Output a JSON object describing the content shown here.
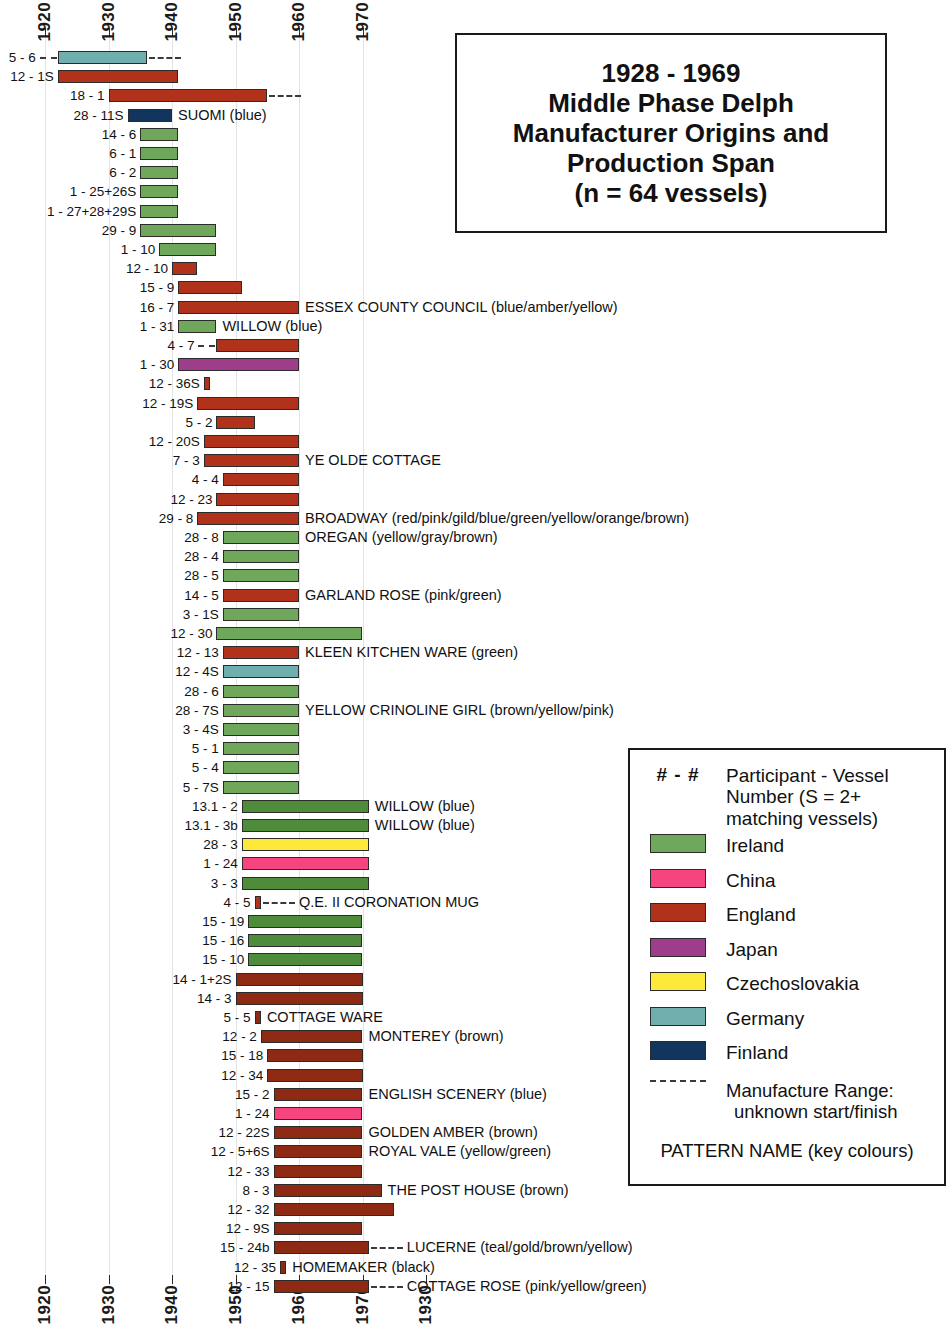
{
  "title": {
    "line1": "1928 - 1969",
    "line2": "Middle Phase Delph",
    "line3": "Manufacturer Origins and",
    "line4": "Production Span",
    "line5": "(n = 64 vessels)"
  },
  "axis": {
    "top_ticks": [
      "1920",
      "1930",
      "1940",
      "1950",
      "1960",
      "1970"
    ],
    "bottom_ticks": [
      "1920",
      "1930",
      "1940",
      "1950",
      "1960",
      "1970",
      "1930"
    ]
  },
  "legend": {
    "key_symbol": "# - #",
    "key_description_l1": "Participant - Vessel",
    "key_description_l2": "Number (S = 2+",
    "key_description_l3": "matching vessels)",
    "countries": [
      {
        "label": "Ireland",
        "color": "#6fa85a"
      },
      {
        "label": "China",
        "color": "#f5447e"
      },
      {
        "label": "England",
        "color": "#b0321a"
      },
      {
        "label": "Japan",
        "color": "#9e3d8c"
      },
      {
        "label": "Czechoslovakia",
        "color": "#fce93a"
      },
      {
        "label": "Germany",
        "color": "#6fb0ae"
      },
      {
        "label": "Finland",
        "color": "#12355e"
      }
    ],
    "range_note_l1": "Manufacture Range:",
    "range_note_l2": "unknown start/finish",
    "footer": "PATTERN NAME (key colours)"
  },
  "chart_data": {
    "type": "bar",
    "title": "1928 - 1969 Middle Phase Delph Manufacturer Origins and Production Span (n = 64 vessels)",
    "xlabel": "",
    "ylabel": "",
    "xlim": [
      1917,
      1978
    ],
    "grid": true,
    "legend_position": "bottom-right",
    "orientation": "horizontal",
    "note": "Each row is one participant-vessel: a coloured span bar for known manufacture range, dashed line for unknown start/finish.",
    "rows": [
      {
        "id": "5 - 6",
        "country": "Germany",
        "color": "#6fb0ae",
        "start": 1922,
        "end": 1936,
        "dash_left": true,
        "dash_right": true,
        "pattern": ""
      },
      {
        "id": "12 - 1S",
        "country": "England",
        "color": "#b0321a",
        "start": 1922,
        "end": 1941,
        "dash_left": false,
        "dash_right": false,
        "pattern": ""
      },
      {
        "id": "18 - 1",
        "country": "England",
        "color": "#b0321a",
        "start": 1930,
        "end": 1955,
        "dash_left": false,
        "dash_right": true,
        "pattern": ""
      },
      {
        "id": "28 - 11S",
        "country": "Finland",
        "color": "#12355e",
        "start": 1933,
        "end": 1940,
        "dash_left": false,
        "dash_right": false,
        "pattern": "SUOMI (blue)"
      },
      {
        "id": "14 - 6",
        "country": "Ireland",
        "color": "#6fa85a",
        "start": 1935,
        "end": 1941,
        "dash_left": false,
        "dash_right": false,
        "pattern": ""
      },
      {
        "id": "6 - 1",
        "country": "Ireland",
        "color": "#6fa85a",
        "start": 1935,
        "end": 1941,
        "dash_left": false,
        "dash_right": false,
        "pattern": ""
      },
      {
        "id": "6 - 2",
        "country": "Ireland",
        "color": "#6fa85a",
        "start": 1935,
        "end": 1941,
        "dash_left": false,
        "dash_right": false,
        "pattern": ""
      },
      {
        "id": "1 - 25+26S",
        "country": "Ireland",
        "color": "#6fa85a",
        "start": 1935,
        "end": 1941,
        "dash_left": false,
        "dash_right": false,
        "pattern": ""
      },
      {
        "id": "1 - 27+28+29S",
        "country": "Ireland",
        "color": "#6fa85a",
        "start": 1935,
        "end": 1941,
        "dash_left": false,
        "dash_right": false,
        "pattern": ""
      },
      {
        "id": "29 - 9",
        "country": "Ireland",
        "color": "#6fa85a",
        "start": 1935,
        "end": 1947,
        "dash_left": false,
        "dash_right": false,
        "pattern": ""
      },
      {
        "id": "1 - 10",
        "country": "Ireland",
        "color": "#6fa85a",
        "start": 1938,
        "end": 1947,
        "dash_left": false,
        "dash_right": false,
        "pattern": ""
      },
      {
        "id": "12 - 10",
        "country": "England",
        "color": "#b0321a",
        "start": 1940,
        "end": 1944,
        "dash_left": false,
        "dash_right": false,
        "pattern": ""
      },
      {
        "id": "15 - 9",
        "country": "England",
        "color": "#b0321a",
        "start": 1941,
        "end": 1951,
        "dash_left": false,
        "dash_right": false,
        "pattern": ""
      },
      {
        "id": "16 - 7",
        "country": "England",
        "color": "#b0321a",
        "start": 1941,
        "end": 1960,
        "dash_left": false,
        "dash_right": false,
        "pattern": "ESSEX COUNTY COUNCIL (blue/amber/yellow)"
      },
      {
        "id": "1 - 31",
        "country": "Ireland",
        "color": "#6fa85a",
        "start": 1941,
        "end": 1947,
        "dash_left": false,
        "dash_right": false,
        "pattern": "WILLOW (blue)"
      },
      {
        "id": "4 - 7",
        "country": "England",
        "color": "#b0321a",
        "start": 1947,
        "end": 1960,
        "dash_left": true,
        "dash_right": false,
        "pattern": ""
      },
      {
        "id": "1 - 30",
        "country": "Japan",
        "color": "#9e3d8c",
        "start": 1941,
        "end": 1960,
        "dash_left": false,
        "dash_right": false,
        "pattern": ""
      },
      {
        "id": "12 - 36S",
        "country": "England",
        "color": "#b0321a",
        "start": 1945,
        "end": 1946,
        "dash_left": false,
        "dash_right": false,
        "pattern": ""
      },
      {
        "id": "12 - 19S",
        "country": "England",
        "color": "#b0321a",
        "start": 1944,
        "end": 1960,
        "dash_left": false,
        "dash_right": false,
        "pattern": ""
      },
      {
        "id": "5 - 2",
        "country": "England",
        "color": "#b0321a",
        "start": 1947,
        "end": 1953,
        "dash_left": false,
        "dash_right": false,
        "pattern": ""
      },
      {
        "id": "12 - 20S",
        "country": "England",
        "color": "#b0321a",
        "start": 1945,
        "end": 1960,
        "dash_left": false,
        "dash_right": false,
        "pattern": ""
      },
      {
        "id": "7 - 3",
        "country": "England",
        "color": "#b0321a",
        "start": 1945,
        "end": 1960,
        "dash_left": false,
        "dash_right": false,
        "pattern": "YE OLDE COTTAGE"
      },
      {
        "id": "4 - 4",
        "country": "England",
        "color": "#b0321a",
        "start": 1948,
        "end": 1960,
        "dash_left": false,
        "dash_right": false,
        "pattern": ""
      },
      {
        "id": "12 - 23",
        "country": "England",
        "color": "#b0321a",
        "start": 1947,
        "end": 1960,
        "dash_left": false,
        "dash_right": false,
        "pattern": ""
      },
      {
        "id": "29 - 8",
        "country": "England",
        "color": "#b0321a",
        "start": 1944,
        "end": 1960,
        "dash_left": false,
        "dash_right": false,
        "pattern": "BROADWAY (red/pink/gild/blue/green/yellow/orange/brown)"
      },
      {
        "id": "28 - 8",
        "country": "Ireland",
        "color": "#6fa85a",
        "start": 1948,
        "end": 1960,
        "dash_left": false,
        "dash_right": false,
        "pattern": "OREGAN (yellow/gray/brown)"
      },
      {
        "id": "28 - 4",
        "country": "Ireland",
        "color": "#6fa85a",
        "start": 1948,
        "end": 1960,
        "dash_left": false,
        "dash_right": false,
        "pattern": ""
      },
      {
        "id": "28 - 5",
        "country": "Ireland",
        "color": "#6fa85a",
        "start": 1948,
        "end": 1960,
        "dash_left": false,
        "dash_right": false,
        "pattern": ""
      },
      {
        "id": "14 - 5",
        "country": "England",
        "color": "#b0321a",
        "start": 1948,
        "end": 1960,
        "dash_left": false,
        "dash_right": false,
        "pattern": "GARLAND ROSE (pink/green)"
      },
      {
        "id": "3 - 1S",
        "country": "Ireland",
        "color": "#6fa85a",
        "start": 1948,
        "end": 1960,
        "dash_left": false,
        "dash_right": false,
        "pattern": ""
      },
      {
        "id": "12 - 30",
        "country": "Ireland",
        "color": "#6fa85a",
        "start": 1947,
        "end": 1970,
        "dash_left": false,
        "dash_right": false,
        "pattern": ""
      },
      {
        "id": "12 - 13",
        "country": "England",
        "color": "#b0321a",
        "start": 1948,
        "end": 1960,
        "dash_left": false,
        "dash_right": false,
        "pattern": "KLEEN KITCHEN WARE (green)"
      },
      {
        "id": "12 - 4S",
        "country": "Germany",
        "color": "#6fb0ae",
        "start": 1948,
        "end": 1960,
        "dash_left": false,
        "dash_right": false,
        "pattern": ""
      },
      {
        "id": "28 - 6",
        "country": "Ireland",
        "color": "#6fa85a",
        "start": 1948,
        "end": 1960,
        "dash_left": false,
        "dash_right": false,
        "pattern": ""
      },
      {
        "id": "28 - 7S",
        "country": "Ireland",
        "color": "#6fa85a",
        "start": 1948,
        "end": 1960,
        "dash_left": false,
        "dash_right": false,
        "pattern": "YELLOW CRINOLINE GIRL (brown/yellow/pink)"
      },
      {
        "id": "3 - 4S",
        "country": "Ireland",
        "color": "#6fa85a",
        "start": 1948,
        "end": 1960,
        "dash_left": false,
        "dash_right": false,
        "pattern": ""
      },
      {
        "id": "5 - 1",
        "country": "Ireland",
        "color": "#6fa85a",
        "start": 1948,
        "end": 1960,
        "dash_left": false,
        "dash_right": false,
        "pattern": ""
      },
      {
        "id": "5 - 4",
        "country": "Ireland",
        "color": "#6fa85a",
        "start": 1948,
        "end": 1960,
        "dash_left": false,
        "dash_right": false,
        "pattern": ""
      },
      {
        "id": "5 - 7S",
        "country": "Ireland",
        "color": "#6fa85a",
        "start": 1948,
        "end": 1960,
        "dash_left": false,
        "dash_right": false,
        "pattern": ""
      },
      {
        "id": "13.1 - 2",
        "country": "Ireland",
        "color": "#4e8b3a",
        "start": 1951,
        "end": 1971,
        "dash_left": false,
        "dash_right": false,
        "pattern": "WILLOW (blue)"
      },
      {
        "id": "13.1 - 3b",
        "country": "Ireland",
        "color": "#4e8b3a",
        "start": 1951,
        "end": 1971,
        "dash_left": false,
        "dash_right": false,
        "pattern": "WILLOW (blue)"
      },
      {
        "id": "28 - 3",
        "country": "Czechoslovakia",
        "color": "#fce93a",
        "start": 1951,
        "end": 1971,
        "dash_left": false,
        "dash_right": false,
        "pattern": ""
      },
      {
        "id": "1 - 24",
        "country": "China",
        "color": "#f5447e",
        "start": 1951,
        "end": 1971,
        "dash_left": false,
        "dash_right": false,
        "pattern": ""
      },
      {
        "id": "3 - 3",
        "country": "Ireland",
        "color": "#4e8b3a",
        "start": 1951,
        "end": 1971,
        "dash_left": false,
        "dash_right": false,
        "pattern": ""
      },
      {
        "id": "4 - 5",
        "country": "England",
        "color": "#b0321a",
        "start": 1953,
        "end": 1954,
        "dash_left": false,
        "dash_right": true,
        "pattern": "Q.E. II CORONATION MUG"
      },
      {
        "id": "15 - 19",
        "country": "Ireland",
        "color": "#4e8b3a",
        "start": 1952,
        "end": 1970,
        "dash_left": false,
        "dash_right": false,
        "pattern": ""
      },
      {
        "id": "15 - 16",
        "country": "Ireland",
        "color": "#4e8b3a",
        "start": 1952,
        "end": 1970,
        "dash_left": false,
        "dash_right": false,
        "pattern": ""
      },
      {
        "id": "15 - 10",
        "country": "Ireland",
        "color": "#4e8b3a",
        "start": 1952,
        "end": 1970,
        "dash_left": false,
        "dash_right": false,
        "pattern": ""
      },
      {
        "id": "14 - 1+2S",
        "country": "England",
        "color": "#8e2a14",
        "start": 1950,
        "end": 1970,
        "dash_left": false,
        "dash_right": false,
        "pattern": ""
      },
      {
        "id": "14 - 3",
        "country": "England",
        "color": "#8e2a14",
        "start": 1950,
        "end": 1970,
        "dash_left": false,
        "dash_right": false,
        "pattern": ""
      },
      {
        "id": "5 - 5",
        "country": "England",
        "color": "#8e2a14",
        "start": 1953,
        "end": 1954,
        "dash_left": false,
        "dash_right": false,
        "pattern": "COTTAGE WARE"
      },
      {
        "id": "12 - 2",
        "country": "England",
        "color": "#8e2a14",
        "start": 1954,
        "end": 1970,
        "dash_left": false,
        "dash_right": false,
        "pattern": "MONTEREY (brown)"
      },
      {
        "id": "15 - 18",
        "country": "England",
        "color": "#8e2a14",
        "start": 1955,
        "end": 1970,
        "dash_left": false,
        "dash_right": false,
        "pattern": ""
      },
      {
        "id": "12 - 34",
        "country": "England",
        "color": "#8e2a14",
        "start": 1955,
        "end": 1970,
        "dash_left": false,
        "dash_right": false,
        "pattern": ""
      },
      {
        "id": "15 - 2",
        "country": "England",
        "color": "#8e2a14",
        "start": 1956,
        "end": 1970,
        "dash_left": false,
        "dash_right": false,
        "pattern": "ENGLISH SCENERY (blue)"
      },
      {
        "id": "1 - 24",
        "country": "China",
        "color": "#f5447e",
        "start": 1956,
        "end": 1970,
        "dash_left": false,
        "dash_right": false,
        "pattern": ""
      },
      {
        "id": "12 - 22S",
        "country": "England",
        "color": "#8e2a14",
        "start": 1956,
        "end": 1970,
        "dash_left": false,
        "dash_right": false,
        "pattern": "GOLDEN AMBER (brown)"
      },
      {
        "id": "12 - 5+6S",
        "country": "England",
        "color": "#8e2a14",
        "start": 1956,
        "end": 1970,
        "dash_left": false,
        "dash_right": false,
        "pattern": "ROYAL VALE (yellow/green)"
      },
      {
        "id": "12 - 33",
        "country": "England",
        "color": "#8e2a14",
        "start": 1956,
        "end": 1970,
        "dash_left": false,
        "dash_right": false,
        "pattern": ""
      },
      {
        "id": "8 - 3",
        "country": "England",
        "color": "#8e2a14",
        "start": 1956,
        "end": 1973,
        "dash_left": false,
        "dash_right": false,
        "pattern": "THE POST HOUSE (brown)"
      },
      {
        "id": "12 - 32",
        "country": "England",
        "color": "#8e2a14",
        "start": 1956,
        "end": 1975,
        "dash_left": false,
        "dash_right": false,
        "pattern": ""
      },
      {
        "id": "12 - 9S",
        "country": "England",
        "color": "#8e2a14",
        "start": 1956,
        "end": 1970,
        "dash_left": false,
        "dash_right": false,
        "pattern": ""
      },
      {
        "id": "15 - 24b",
        "country": "England",
        "color": "#8e2a14",
        "start": 1956,
        "end": 1971,
        "dash_left": false,
        "dash_right": true,
        "pattern": "LUCERNE (teal/gold/brown/yellow)"
      },
      {
        "id": "12 - 35",
        "country": "England",
        "color": "#8e2a14",
        "start": 1957,
        "end": 1958,
        "dash_left": false,
        "dash_right": false,
        "pattern": "HOMEMAKER (black)"
      },
      {
        "id": "12 - 15",
        "country": "England",
        "color": "#8e2a14",
        "start": 1956,
        "end": 1971,
        "dash_left": false,
        "dash_right": true,
        "pattern": "COTTAGE ROSE (pink/yellow/green)"
      }
    ]
  }
}
